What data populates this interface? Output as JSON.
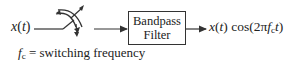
{
  "diagram": {
    "input": {
      "signal": "x",
      "arg": "t"
    },
    "switch": {
      "icon": "rotating-switch-icon"
    },
    "filter": {
      "line1": "Bandpass",
      "line2": "Filter"
    },
    "output": {
      "signal": "x",
      "arg": "t",
      "func": "cos",
      "expr_prefix": "(2π",
      "fc": "f",
      "fc_sub": "c",
      "t": "t",
      "expr_suffix": ")"
    },
    "footnote": {
      "symbol": "f",
      "symbol_sub": "c",
      "text": " = switching frequency"
    },
    "colors": {
      "stroke": "#333333",
      "text": "#222222",
      "background": "#ffffff"
    }
  }
}
